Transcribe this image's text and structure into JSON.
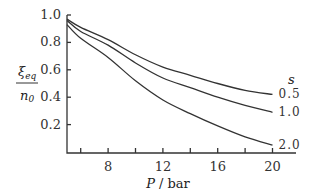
{
  "chart_data": {
    "type": "line",
    "title": "",
    "xlabel": "P / bar",
    "ylabel": "ξeq / n0",
    "xlim": [
      5,
      21.5
    ],
    "ylim": [
      0,
      1.0
    ],
    "x_ticks": [
      6,
      8,
      10,
      12,
      14,
      16,
      18,
      20
    ],
    "x_tick_labels": [
      "8",
      "12",
      "16",
      "20"
    ],
    "x_tick_label_values": [
      8,
      12,
      16,
      20
    ],
    "y_ticks": [
      0.2,
      0.4,
      0.6,
      0.8,
      1.0
    ],
    "y_tick_labels": [
      "0.2",
      "0.4",
      "0.6",
      "0.8",
      "1.0"
    ],
    "grid": false,
    "legend_title": "s",
    "x": [
      5,
      6,
      8,
      10,
      12,
      14,
      16,
      18,
      20
    ],
    "series": [
      {
        "name": "0.5",
        "values": [
          0.97,
          0.91,
          0.82,
          0.71,
          0.62,
          0.56,
          0.5,
          0.45,
          0.42
        ]
      },
      {
        "name": "1.0",
        "values": [
          0.96,
          0.88,
          0.78,
          0.65,
          0.54,
          0.47,
          0.4,
          0.34,
          0.29
        ]
      },
      {
        "name": "2.0",
        "values": [
          0.93,
          0.83,
          0.69,
          0.52,
          0.38,
          0.28,
          0.19,
          0.11,
          0.05
        ]
      }
    ]
  },
  "labels": {
    "y_numerator": "ξ",
    "y_numerator_sub": "eq",
    "y_denominator": "n",
    "y_denominator_sub": "0",
    "x_axis": "P / bar",
    "legend_title": "s"
  }
}
